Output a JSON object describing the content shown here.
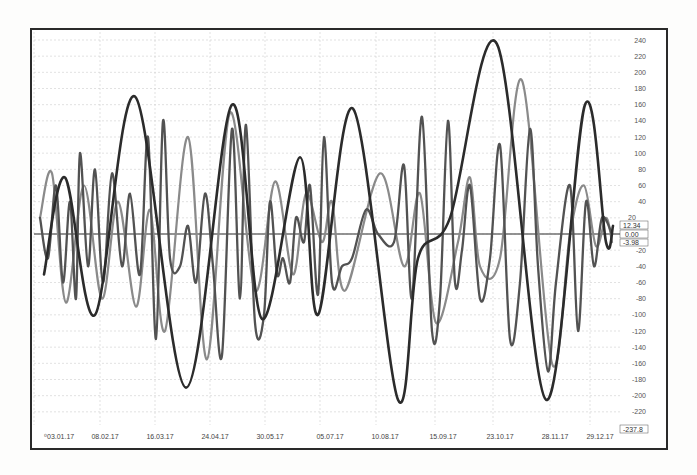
{
  "chart_data": {
    "type": "line",
    "title": "",
    "xlabel": "",
    "ylabel": "",
    "ylim": [
      -237.8,
      240
    ],
    "grid": true,
    "legend": "none",
    "y_ticks": [
      240,
      220,
      200,
      180,
      160,
      140,
      120,
      100,
      80,
      60,
      40,
      20,
      0,
      -20,
      -40,
      -60,
      -80,
      -100,
      -120,
      -140,
      -160,
      -180,
      -200,
      -220
    ],
    "y_axis_bottom_label": "-237.8",
    "x_tick_labels": [
      "03.01.17",
      "08.02.17",
      "16.03.17",
      "24.04.17",
      "30.05.17",
      "05.07.17",
      "10.08.17",
      "15.09.17",
      "23.10.17",
      "28.11.17",
      "29.12.17"
    ],
    "last_value_labels": [
      "12.34",
      "0.00",
      "-3.98"
    ],
    "series": [
      {
        "name": "series-1-dark",
        "color": "#2b2b2b",
        "width": 2.6,
        "points": [
          [
            44,
            -50
          ],
          [
            65,
            70
          ],
          [
            95,
            -100
          ],
          [
            135,
            170
          ],
          [
            186,
            -190
          ],
          [
            232,
            160
          ],
          [
            262,
            -105
          ],
          [
            300,
            95
          ],
          [
            318,
            -100
          ],
          [
            353,
            155
          ],
          [
            398,
            -205
          ],
          [
            418,
            -30
          ],
          [
            450,
            20
          ],
          [
            497,
            235
          ],
          [
            546,
            -205
          ],
          [
            585,
            160
          ],
          [
            606,
            -10
          ],
          [
            613,
            10
          ]
        ]
      },
      {
        "name": "series-2-gray",
        "color": "#8a8a8a",
        "width": 2.2,
        "points": [
          [
            40,
            20
          ],
          [
            52,
            75
          ],
          [
            66,
            -85
          ],
          [
            84,
            60
          ],
          [
            102,
            -80
          ],
          [
            118,
            40
          ],
          [
            136,
            -90
          ],
          [
            150,
            30
          ],
          [
            165,
            -120
          ],
          [
            188,
            120
          ],
          [
            207,
            -155
          ],
          [
            230,
            150
          ],
          [
            255,
            -70
          ],
          [
            275,
            65
          ],
          [
            293,
            -50
          ],
          [
            306,
            50
          ],
          [
            322,
            -10
          ],
          [
            332,
            40
          ],
          [
            345,
            -70
          ],
          [
            380,
            75
          ],
          [
            404,
            -40
          ],
          [
            420,
            50
          ],
          [
            436,
            -110
          ],
          [
            458,
            -10
          ],
          [
            470,
            70
          ],
          [
            480,
            -40
          ],
          [
            500,
            -30
          ],
          [
            522,
            190
          ],
          [
            552,
            -160
          ],
          [
            570,
            0
          ],
          [
            584,
            60
          ],
          [
            596,
            -15
          ],
          [
            606,
            20
          ],
          [
            612,
            -10
          ]
        ]
      },
      {
        "name": "series-3-hf",
        "color": "#525252",
        "width": 2.3,
        "points": [
          [
            40,
            20
          ],
          [
            48,
            -30
          ],
          [
            56,
            60
          ],
          [
            63,
            -60
          ],
          [
            70,
            40
          ],
          [
            76,
            -80
          ],
          [
            80,
            100
          ],
          [
            88,
            -40
          ],
          [
            95,
            80
          ],
          [
            103,
            -60
          ],
          [
            112,
            75
          ],
          [
            122,
            -40
          ],
          [
            130,
            50
          ],
          [
            140,
            -50
          ],
          [
            148,
            120
          ],
          [
            156,
            -130
          ],
          [
            163,
            140
          ],
          [
            170,
            -30
          ],
          [
            180,
            -40
          ],
          [
            188,
            10
          ],
          [
            196,
            -60
          ],
          [
            205,
            50
          ],
          [
            213,
            -40
          ],
          [
            222,
            -150
          ],
          [
            232,
            130
          ],
          [
            240,
            -80
          ],
          [
            246,
            135
          ],
          [
            255,
            -110
          ],
          [
            264,
            -100
          ],
          [
            270,
            40
          ],
          [
            277,
            -50
          ],
          [
            283,
            -30
          ],
          [
            290,
            -60
          ],
          [
            296,
            20
          ],
          [
            304,
            -10
          ],
          [
            310,
            60
          ],
          [
            318,
            -75
          ],
          [
            324,
            120
          ],
          [
            332,
            -60
          ],
          [
            342,
            -40
          ],
          [
            352,
            -30
          ],
          [
            366,
            30
          ],
          [
            378,
            0
          ],
          [
            394,
            -10
          ],
          [
            404,
            85
          ],
          [
            412,
            -80
          ],
          [
            422,
            145
          ],
          [
            432,
            -120
          ],
          [
            440,
            -80
          ],
          [
            448,
            140
          ],
          [
            455,
            -60
          ],
          [
            462,
            -20
          ],
          [
            470,
            60
          ],
          [
            480,
            -80
          ],
          [
            490,
            -30
          ],
          [
            500,
            110
          ],
          [
            510,
            -130
          ],
          [
            520,
            -60
          ],
          [
            530,
            130
          ],
          [
            538,
            -40
          ],
          [
            548,
            -170
          ],
          [
            556,
            -60
          ],
          [
            570,
            60
          ],
          [
            578,
            -120
          ],
          [
            586,
            40
          ],
          [
            594,
            -40
          ],
          [
            602,
            20
          ],
          [
            612,
            0
          ]
        ]
      }
    ]
  },
  "y_axis": {
    "ticks": [
      "240",
      "220",
      "200",
      "180",
      "160",
      "140",
      "120",
      "100",
      "80",
      "60",
      "40",
      "20",
      "0",
      "-20",
      "-40",
      "-60",
      "-80",
      "-100",
      "-120",
      "-140",
      "-160",
      "-180",
      "-200",
      "-220"
    ],
    "bottom_label": "-237.8"
  },
  "x_axis": {
    "ticks": [
      "03.01.17",
      "08.02.17",
      "16.03.17",
      "24.04.17",
      "30.05.17",
      "05.07.17",
      "10.08.17",
      "15.09.17",
      "23.10.17",
      "28.11.17",
      "29.12.17"
    ]
  },
  "value_boxes": [
    "12.34",
    "0.00",
    "-3.98"
  ]
}
